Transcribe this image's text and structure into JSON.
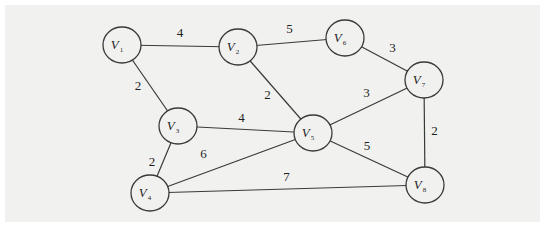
{
  "graph": {
    "type": "undirected-weighted",
    "nodes": [
      {
        "id": "V1",
        "base": "V",
        "sub": "1"
      },
      {
        "id": "V2",
        "base": "V",
        "sub": "2"
      },
      {
        "id": "V3",
        "base": "V",
        "sub": "3"
      },
      {
        "id": "V4",
        "base": "V",
        "sub": "4"
      },
      {
        "id": "V5",
        "base": "V",
        "sub": "5"
      },
      {
        "id": "V6",
        "base": "V",
        "sub": "6"
      },
      {
        "id": "V7",
        "base": "V",
        "sub": "7"
      },
      {
        "id": "V8",
        "base": "V",
        "sub": "8"
      }
    ],
    "edges": [
      {
        "from": "V1",
        "to": "V2",
        "weight": "4"
      },
      {
        "from": "V1",
        "to": "V3",
        "weight": "2"
      },
      {
        "from": "V2",
        "to": "V6",
        "weight": "5"
      },
      {
        "from": "V2",
        "to": "V5",
        "weight": "2"
      },
      {
        "from": "V6",
        "to": "V7",
        "weight": "3"
      },
      {
        "from": "V3",
        "to": "V5",
        "weight": "4"
      },
      {
        "from": "V3",
        "to": "V4",
        "weight": "2"
      },
      {
        "from": "V4",
        "to": "V5",
        "weight": "6"
      },
      {
        "from": "V5",
        "to": "V7",
        "weight": "3"
      },
      {
        "from": "V5",
        "to": "V8",
        "weight": "5"
      },
      {
        "from": "V7",
        "to": "V8",
        "weight": "2"
      },
      {
        "from": "V4",
        "to": "V8",
        "weight": "7"
      }
    ]
  }
}
